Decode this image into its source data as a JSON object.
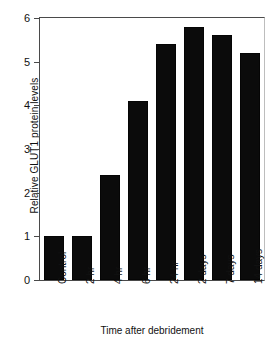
{
  "chart_data": {
    "type": "bar",
    "title": "",
    "xlabel": "Time after debridement",
    "ylabel": "Relative GLUT1 protein levels",
    "categories": [
      "Control",
      "2 hr",
      "4 hr",
      "6 hr",
      "24 hr",
      "2 days",
      "7 days",
      "14 days"
    ],
    "values": [
      1.0,
      1.0,
      2.4,
      4.1,
      5.4,
      5.8,
      5.6,
      5.2
    ],
    "ylim": [
      0,
      6
    ],
    "yticks": [
      0,
      1,
      2,
      3,
      4,
      5,
      6
    ],
    "ytick_labels": [
      "0",
      "1",
      "2",
      "3",
      "4",
      "5",
      "6"
    ],
    "grid": false,
    "legend": null,
    "bar_color": "#0b0b0b",
    "axis_color": "#4a4a4a",
    "background": "#ffffff"
  }
}
